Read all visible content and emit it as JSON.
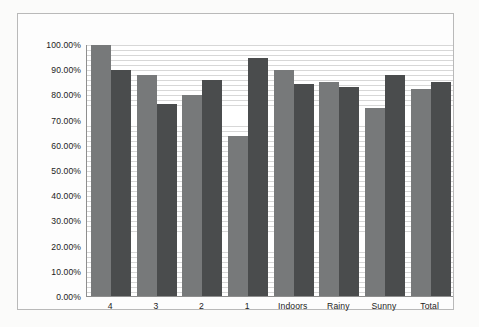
{
  "chart_data": {
    "type": "bar",
    "title": "",
    "subtitle": "",
    "xlabel": "",
    "ylabel": "",
    "categories": [
      "4",
      "3",
      "2",
      "1",
      "Indoors",
      "Rainy",
      "Sunny",
      "Total"
    ],
    "series": [
      {
        "name": "Series 1",
        "color": "#77797a",
        "values": [
          100.0,
          88.0,
          80.0,
          64.0,
          90.0,
          85.5,
          75.0,
          82.5
        ]
      },
      {
        "name": "Series 2",
        "color": "#4a4c4d",
        "values": [
          90.0,
          76.5,
          86.0,
          95.0,
          84.5,
          83.5,
          88.0,
          85.5
        ]
      }
    ],
    "ylim": [
      0,
      100
    ],
    "ytick_values": [
      0,
      10,
      20,
      30,
      40,
      50,
      60,
      70,
      80,
      90,
      100
    ],
    "ytick_labels": [
      "0.00%",
      "10.00%",
      "20.00%",
      "30.00%",
      "40.00%",
      "50.00%",
      "60.00%",
      "70.00%",
      "80.00%",
      "90.00%",
      "100.00%"
    ],
    "grid": true,
    "grid_orientation": "horizontal",
    "grid_color": "#d7d7d7",
    "legend": false,
    "legend_position": "none",
    "plot_background": "#ffffff",
    "axis_color": "#8e8e8e",
    "frame_border_color": "#b9b9b9",
    "page_background": "#fbfbfa"
  }
}
